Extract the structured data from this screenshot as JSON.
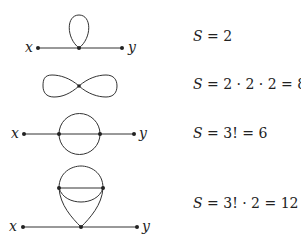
{
  "diagrams": [
    {
      "name": "tadpole",
      "external_labels": {
        "left": "x",
        "right": "y"
      },
      "symmetry": {
        "symbol": "S",
        "expression": " = 2"
      }
    },
    {
      "name": "figure-eight",
      "external_labels": null,
      "symmetry": {
        "symbol": "S",
        "expression": " = 2 · 2 · 2 = 8"
      }
    },
    {
      "name": "sunset",
      "external_labels": {
        "left": "x",
        "right": "y"
      },
      "symmetry": {
        "symbol": "S",
        "expression": " = 3! = 6"
      }
    },
    {
      "name": "double-scoop",
      "external_labels": {
        "left": "x",
        "right": "y"
      },
      "symmetry": {
        "symbol": "S",
        "expression": " = 3! · 2 = 12"
      }
    }
  ],
  "colors": {
    "ink": "#222222",
    "background": "#ffffff"
  }
}
